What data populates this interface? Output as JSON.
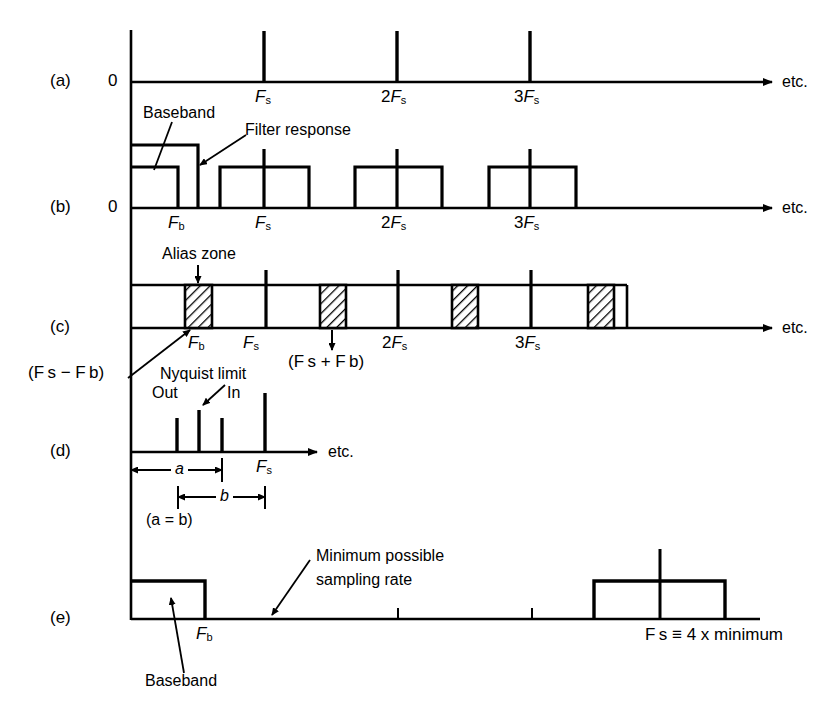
{
  "figure": {
    "background": "#ffffff",
    "ink": "#000000",
    "panels": [
      {
        "id": "a",
        "label": "(a)",
        "origin_label": "0",
        "etc_label": "etc.",
        "tick_labels": [
          "Fs",
          "2Fs",
          "3Fs"
        ]
      },
      {
        "id": "b",
        "label": "(b)",
        "origin_label": "0",
        "etc_label": "etc.",
        "tick_labels": [
          "Fb",
          "Fs",
          "2Fs",
          "3Fs"
        ],
        "annotations": [
          "Baseband",
          "Filter response"
        ]
      },
      {
        "id": "c",
        "label": "(c)",
        "etc_label": "etc.",
        "tick_labels": [
          "Fb",
          "Fs",
          "2Fs",
          "3Fs"
        ],
        "annotations": [
          "Alias zone",
          "(Fs − Fb)",
          "Nyquist limit",
          "(Fs + Fb)"
        ]
      },
      {
        "id": "d",
        "label": "(d)",
        "etc_label": "etc.",
        "tick_labels": [
          "Fs"
        ],
        "annotations": [
          "Out",
          "In",
          "a",
          "b",
          "(a = b)"
        ]
      },
      {
        "id": "e",
        "label": "(e)",
        "tick_labels": [
          "Fb"
        ],
        "annotations": [
          "Minimum possible sampling rate",
          "Baseband",
          "Fs ≡ 4 x minimum"
        ]
      }
    ]
  },
  "labels": {
    "panel_a": "(a)",
    "panel_b": "(b)",
    "panel_c": "(c)",
    "panel_d": "(d)",
    "panel_e": "(e)",
    "zero_a": "0",
    "zero_b": "0",
    "etc_a": "etc.",
    "etc_b": "etc.",
    "etc_c": "etc.",
    "etc_d": "etc.",
    "baseband_b": "Baseband",
    "filter_response": "Filter response",
    "alias_zone": "Alias zone",
    "nyquist_limit": "Nyquist limit",
    "out": "Out",
    "in": "In",
    "dim_a": "a",
    "dim_b": "b",
    "a_equals_b": "(a = b)",
    "min_rate_line1": "Minimum possible",
    "min_rate_line2": "sampling rate",
    "baseband_e": "Baseband"
  },
  "ticks": {
    "Fs": {
      "main": "F",
      "sub": "s"
    },
    "Fb": {
      "main": "F",
      "sub": "b"
    },
    "twoFs": {
      "num": "2",
      "main": "F",
      "sub": "s"
    },
    "threeFs": {
      "num": "3",
      "main": "F",
      "sub": "s"
    }
  },
  "expressions": {
    "fs_minus_fb": "(F s − F b)",
    "fs_plus_fb": "(F s + F b)",
    "fs_equiv": "F s ≡ 4 x minimum",
    "fs_equiv_parts": {
      "f": "F",
      "sub": "s",
      "equiv": "≡",
      "times": "4 x minimum"
    }
  },
  "geometry": {
    "axis_x": 131,
    "baselines": {
      "a": 82,
      "b": 208,
      "c": 328,
      "d": 452,
      "e": 619
    },
    "x_positions": {
      "Fb": 178,
      "Fs": 265,
      "twoFs": 397,
      "threeFs": 530
    }
  }
}
